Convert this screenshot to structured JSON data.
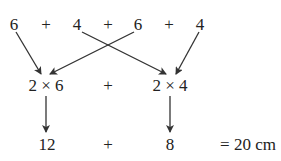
{
  "top_row": [
    "6",
    "+",
    "4",
    "+",
    "6",
    "+",
    "4"
  ],
  "middle_row": {
    "left": "2 × 6",
    "op": "+",
    "right": "2 × 4"
  },
  "bottom_row": {
    "left": "12",
    "op": "+",
    "right": "8",
    "result": "= 20 cm"
  },
  "partial_top_text": "…g…"
}
